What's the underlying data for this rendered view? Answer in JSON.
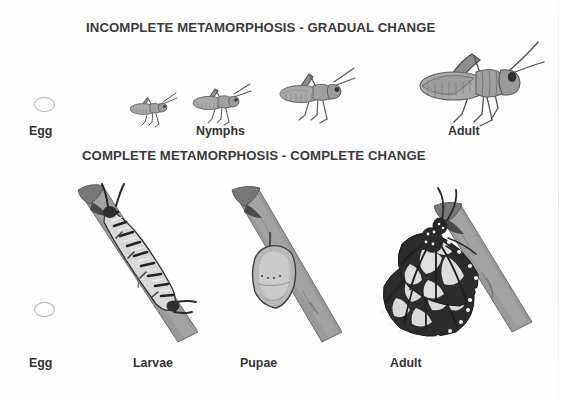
{
  "document": {
    "kind": "educational-diagram",
    "subject": "Insect metamorphosis comparison",
    "background_color": "#ffffff",
    "text_color": "#333333"
  },
  "sections": [
    {
      "id": "incomplete",
      "title": "INCOMPLETE METAMORPHOSIS - GRADUAL CHANGE",
      "stages": [
        {
          "key": "egg",
          "label": "Egg",
          "figure": "egg-oval"
        },
        {
          "key": "nymphs",
          "label": "Nymphs",
          "figure": "grasshopper-nymphs"
        },
        {
          "key": "adult",
          "label": "Adult",
          "figure": "grasshopper-adult"
        }
      ]
    },
    {
      "id": "complete",
      "title": "COMPLETE METAMORPHOSIS - COMPLETE CHANGE",
      "stages": [
        {
          "key": "egg",
          "label": "Egg",
          "figure": "egg-oval"
        },
        {
          "key": "larvae",
          "label": "Larvae",
          "figure": "caterpillar-on-branch"
        },
        {
          "key": "pupae",
          "label": "Pupae",
          "figure": "chrysalis-on-branch"
        },
        {
          "key": "adult",
          "label": "Adult",
          "figure": "monarch-butterfly-on-branch"
        }
      ]
    },
    {
      "id": "metadata",
      "figure_counts": {
        "nymph_instars": 3,
        "grasshopper_adults": 1,
        "butterflies": 1
      }
    }
  ],
  "colors": {
    "ink": "#333333",
    "title_ink": "#3a3a3a",
    "egg_outline": "#b4b4b4",
    "insect_body": "#9a9a9a",
    "insect_dark": "#4a4a4a",
    "branch": "#8d8d8d",
    "wing_dark": "#2a2a2a",
    "wing_light": "#e8e8e8"
  }
}
